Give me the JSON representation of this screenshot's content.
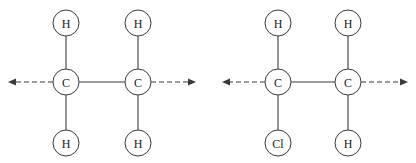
{
  "canvas": {
    "width": 416,
    "height": 163,
    "background": "#ffffff"
  },
  "style": {
    "bond_color": "#3a3a3a",
    "circle_stroke": "#3a3a3a",
    "circle_fill": "#ffffff",
    "label_color": "#1a1a1a",
    "arrow_color": "#3a3a3a",
    "circle_radius": 13,
    "label_font_size": 12,
    "bond_width": 1.1,
    "circle_width": 1.0,
    "arrow_width": 1.2,
    "arrow_dash": "5,3"
  },
  "diagram": {
    "type": "molecular-structure",
    "title": "",
    "molecules": [
      {
        "id": "molecule-1",
        "name": "ethane",
        "atoms": [
          {
            "id": "m1-c-left",
            "element": "C",
            "cx": 66,
            "cy": 82
          },
          {
            "id": "m1-c-right",
            "element": "C",
            "cx": 138,
            "cy": 82
          },
          {
            "id": "m1-h-top-left",
            "element": "H",
            "cx": 66,
            "cy": 23
          },
          {
            "id": "m1-h-top-right",
            "element": "H",
            "cx": 138,
            "cy": 23
          },
          {
            "id": "m1-h-bottom-left",
            "element": "H",
            "cx": 66,
            "cy": 143
          },
          {
            "id": "m1-h-bottom-right",
            "element": "H",
            "cx": 138,
            "cy": 143
          }
        ],
        "bonds": [
          {
            "id": "m1-bond-cc",
            "from": "m1-c-left",
            "to": "m1-c-right",
            "order": 1
          },
          {
            "id": "m1-bond-ch-tl",
            "from": "m1-c-left",
            "to": "m1-h-top-left",
            "order": 1
          },
          {
            "id": "m1-bond-ch-tr",
            "from": "m1-c-right",
            "to": "m1-h-top-right",
            "order": 1
          },
          {
            "id": "m1-bond-ch-bl",
            "from": "m1-c-left",
            "to": "m1-h-bottom-left",
            "order": 1
          },
          {
            "id": "m1-bond-ch-br",
            "from": "m1-c-right",
            "to": "m1-h-bottom-right",
            "order": 1
          }
        ],
        "arrows": [
          {
            "id": "m1-arrow-left",
            "direction": "left",
            "from_atom": "m1-c-left",
            "x1": 53,
            "x2": 8,
            "y": 82,
            "style": "dashed"
          },
          {
            "id": "m1-arrow-right",
            "direction": "right",
            "from_atom": "m1-c-right",
            "x1": 151,
            "x2": 196,
            "y": 82,
            "style": "dashed"
          }
        ]
      },
      {
        "id": "molecule-2",
        "name": "chloroethane",
        "atoms": [
          {
            "id": "m2-c-left",
            "element": "C",
            "cx": 278,
            "cy": 82
          },
          {
            "id": "m2-c-right",
            "element": "C",
            "cx": 348,
            "cy": 82
          },
          {
            "id": "m2-h-top-left",
            "element": "H",
            "cx": 278,
            "cy": 23
          },
          {
            "id": "m2-h-top-right",
            "element": "H",
            "cx": 348,
            "cy": 23
          },
          {
            "id": "m2-cl-bottom-left",
            "element": "Cl",
            "cx": 278,
            "cy": 143
          },
          {
            "id": "m2-h-bottom-right",
            "element": "H",
            "cx": 348,
            "cy": 143
          }
        ],
        "bonds": [
          {
            "id": "m2-bond-cc",
            "from": "m2-c-left",
            "to": "m2-c-right",
            "order": 1
          },
          {
            "id": "m2-bond-ch-tl",
            "from": "m2-c-left",
            "to": "m2-h-top-left",
            "order": 1
          },
          {
            "id": "m2-bond-ch-tr",
            "from": "m2-c-right",
            "to": "m2-h-top-right",
            "order": 1
          },
          {
            "id": "m2-bond-ccl-bl",
            "from": "m2-c-left",
            "to": "m2-cl-bottom-left",
            "order": 1
          },
          {
            "id": "m2-bond-ch-br",
            "from": "m2-c-right",
            "to": "m2-h-bottom-right",
            "order": 1
          }
        ],
        "arrows": [
          {
            "id": "m2-arrow-left",
            "direction": "left",
            "from_atom": "m2-c-left",
            "x1": 265,
            "x2": 222,
            "y": 82,
            "style": "dashed"
          },
          {
            "id": "m2-arrow-right",
            "direction": "right",
            "from_atom": "m2-c-right",
            "x1": 361,
            "x2": 408,
            "y": 82,
            "style": "dashed"
          }
        ]
      }
    ]
  },
  "labels": {
    "carbon": "C",
    "hydrogen": "H",
    "chlorine": "Cl"
  }
}
